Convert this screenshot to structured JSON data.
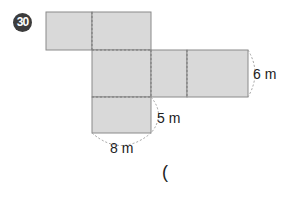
{
  "problem": {
    "number": "30",
    "dimensions": {
      "height_label": "6 m",
      "depth_label": "5 m",
      "width_label": "8 m"
    },
    "answer_open_paren": "("
  },
  "colors": {
    "face_fill": "#d9d9d9",
    "edge": "#8a8a8a",
    "badge": "#3c3c3c"
  }
}
